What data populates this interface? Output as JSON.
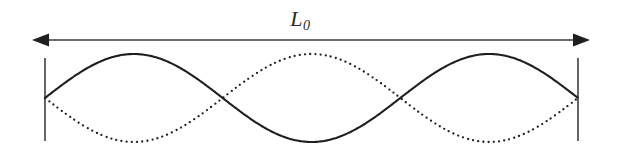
{
  "figure": {
    "kind": "standing-wave-diagram",
    "background_color": "#ffffff",
    "width": 617,
    "height": 150,
    "dimension": {
      "label_main": "L",
      "label_sub": "0",
      "label_full": "L0",
      "label_x": 300,
      "label_y": 8,
      "arrow_y": 40,
      "arrow_x_start": 32,
      "arrow_x_end": 590,
      "arrow_color": "#3a3a3a",
      "arrow_line_width": 1.6,
      "arrow_head_length": 17,
      "arrow_head_half_width": 6.5
    },
    "end_bars": {
      "color": "#555555",
      "line_width": 1.8,
      "top_y": 58,
      "bottom_y": 141,
      "left_x": 45,
      "right_x": 578
    },
    "axis": {
      "x_left": 45,
      "x_right": 578,
      "baseline_y": 98,
      "amplitude": 44
    },
    "curves": [
      {
        "name": "solid-wave",
        "style": "solid",
        "color": "#1f1f1f",
        "line_width": 2.1,
        "phase_sign": 1,
        "cycles": 1.5,
        "description": "solid standing wave, crest first"
      },
      {
        "name": "dotted-wave",
        "style": "dotted",
        "color": "#1f1f1f",
        "line_width": 2.1,
        "dot_radius": 1.15,
        "dot_spacing": 5.2,
        "phase_sign": -1,
        "cycles": 1.5,
        "description": "dotted standing wave, inverted phase (180 degrees out of phase)"
      }
    ],
    "nodes_x": [
      45,
      222,
      400,
      578
    ],
    "antinodes_x": [
      134,
      311,
      489
    ]
  },
  "chart_data": {
    "type": "line",
    "title": "",
    "xlabel": "",
    "ylabel": "",
    "x_range": [
      45,
      578
    ],
    "y_range": [
      54,
      142
    ],
    "grid": false,
    "legend": "none",
    "annotations": [
      {
        "text": "L0",
        "x": 300,
        "y": 20,
        "role": "length-dimension-label"
      }
    ],
    "series": [
      {
        "name": "solid-wave",
        "style": "solid",
        "function": "y = 98 - 44*sin(2*pi*1.5*(x-45)/533)",
        "cycles": 1.5,
        "amplitude": 44,
        "baseline": 98
      },
      {
        "name": "dotted-wave",
        "style": "dotted",
        "function": "y = 98 + 44*sin(2*pi*1.5*(x-45)/533)",
        "cycles": 1.5,
        "amplitude": 44,
        "baseline": 98
      }
    ]
  }
}
